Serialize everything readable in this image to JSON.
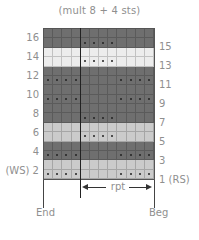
{
  "chart": {
    "title": "(mult 8 + 4 sts)",
    "columns": 12,
    "repeat_start_col": 5,
    "left_row_labels": [
      "16",
      "14",
      "12",
      "10",
      "8",
      "6",
      "4",
      "(WS) 2"
    ],
    "right_row_labels": [
      "15",
      "13",
      "11",
      "9",
      "7",
      "5",
      "3",
      "1 (RS)"
    ],
    "repeat_label": "rpt",
    "end_label": "End",
    "beg_label": "Beg"
  },
  "colors": {
    "dark": "#6f6f6f",
    "light": "#cbcbcb",
    "white": "#ededed",
    "dot": "#222222"
  },
  "rows": [
    {
      "row": 16,
      "shade": "dark",
      "dots": []
    },
    {
      "row": 15,
      "shade": "dark",
      "dots": [
        5,
        6,
        7,
        8
      ]
    },
    {
      "row": 14,
      "shade": "white",
      "dots": []
    },
    {
      "row": 13,
      "shade": "white",
      "dots": [
        5,
        6,
        7,
        8
      ]
    },
    {
      "row": 12,
      "shade": "dark",
      "dots": []
    },
    {
      "row": 11,
      "shade": "dark",
      "dots": [
        1,
        2,
        3,
        4,
        9,
        10,
        11,
        12
      ]
    },
    {
      "row": 10,
      "shade": "dark",
      "dots": []
    },
    {
      "row": 9,
      "shade": "dark",
      "dots": [
        1,
        2,
        3,
        4,
        9,
        10,
        11,
        12
      ]
    },
    {
      "row": 8,
      "shade": "dark",
      "dots": []
    },
    {
      "row": 7,
      "shade": "dark",
      "dots": [
        5,
        6,
        7,
        8
      ]
    },
    {
      "row": 6,
      "shade": "light",
      "dots": []
    },
    {
      "row": 5,
      "shade": "light",
      "dots": [
        5,
        6,
        7,
        8
      ]
    },
    {
      "row": 4,
      "shade": "dark",
      "dots": []
    },
    {
      "row": 3,
      "shade": "dark",
      "dots": [
        1,
        2,
        3,
        4,
        9,
        10,
        11,
        12
      ]
    },
    {
      "row": 2,
      "shade": "light",
      "dots": []
    },
    {
      "row": 1,
      "shade": "light",
      "dots": [
        1,
        2,
        3,
        4,
        9,
        10,
        11,
        12
      ]
    }
  ]
}
